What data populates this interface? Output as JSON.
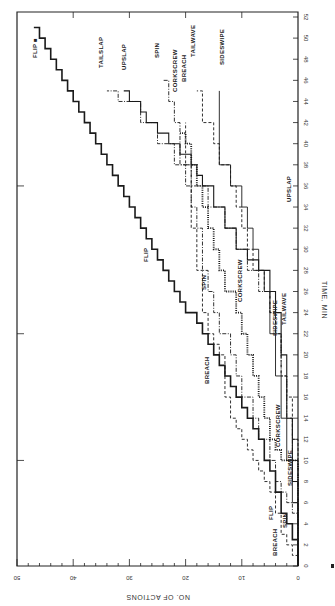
{
  "chart_data": {
    "type": "line",
    "subtype": "step",
    "orientation": "rotated-90",
    "title": "",
    "xlabel": "TIME, MIN",
    "ylabel": "NO. OF ACTIONS",
    "xlim": [
      0,
      52
    ],
    "ylim": [
      0,
      50
    ],
    "x_ticks": [
      0,
      2,
      4,
      6,
      8,
      10,
      12,
      14,
      16,
      18,
      20,
      22,
      24,
      26,
      28,
      30,
      32,
      34,
      36,
      38,
      40,
      42,
      44,
      46,
      48,
      50,
      52
    ],
    "y_ticks": [
      0,
      10,
      20,
      30,
      40,
      50
    ],
    "y_tick_labels": [
      "0",
      "10",
      "20",
      "30",
      "40",
      "50"
    ],
    "grid": false,
    "legend": "inline-labels",
    "series": [
      {
        "name": "FLIP",
        "style": "solid-bold",
        "label_end": "FLIP",
        "label_mid": "FLIP",
        "x": [
          0,
          2.5,
          4,
          5,
          7,
          9,
          10,
          12,
          13,
          14,
          15,
          16,
          17,
          18,
          19,
          20,
          21,
          22,
          23,
          24,
          25,
          26,
          27,
          28,
          29,
          30,
          31,
          32,
          33,
          34,
          35,
          36,
          37,
          38,
          39,
          40,
          41,
          42,
          43,
          44,
          45,
          46,
          47,
          48,
          49,
          50,
          51
        ],
        "y": [
          0,
          1,
          2,
          3,
          4,
          5,
          6,
          7,
          8,
          9,
          10,
          11,
          12,
          13,
          14,
          15,
          16,
          17,
          18,
          20,
          21,
          22,
          23,
          24,
          25,
          26,
          27,
          28,
          29,
          30,
          31,
          32,
          33,
          34,
          35,
          36,
          37,
          38,
          39,
          40,
          41,
          42,
          43,
          44,
          45,
          46,
          47
        ]
      },
      {
        "name": "BREACH",
        "style": "dashed",
        "x": [
          0,
          1,
          2,
          3,
          5,
          7,
          8,
          9,
          10,
          11,
          12,
          13,
          14,
          16,
          18,
          20,
          21,
          22,
          24,
          26,
          28,
          30,
          32,
          34,
          36,
          38,
          40,
          42
        ],
        "y": [
          0,
          1,
          2,
          3,
          4,
          5,
          6,
          7,
          8,
          9,
          10,
          11,
          12,
          13,
          13,
          14,
          15,
          16,
          17,
          17,
          18,
          18,
          19,
          19,
          19,
          20,
          20,
          20
        ]
      },
      {
        "name": "SPIN",
        "style": "dash-dot",
        "x": [
          0,
          5,
          6,
          7,
          8,
          10,
          12,
          14,
          16,
          18,
          20,
          22,
          24,
          26,
          28,
          30,
          32,
          34,
          36,
          38,
          40,
          42,
          44,
          46
        ],
        "y": [
          0,
          1,
          2,
          3,
          4,
          5,
          7,
          8,
          10,
          11,
          12,
          14,
          15,
          16,
          17,
          17,
          18,
          19,
          20,
          21,
          21,
          22,
          23,
          24
        ]
      },
      {
        "name": "CORKSCREW",
        "style": "dotted-bold",
        "x": [
          0,
          10,
          11,
          12,
          14,
          16,
          18,
          20,
          22,
          24,
          26,
          28,
          30,
          32,
          34,
          36,
          38,
          40,
          41
        ],
        "y": [
          0,
          3,
          4,
          5,
          6,
          7,
          8,
          9,
          10,
          11,
          13,
          14,
          15,
          16,
          17,
          18,
          19,
          20,
          21
        ]
      },
      {
        "name": "SIDESWIPE",
        "style": "solid-thin",
        "x": [
          0,
          6,
          10,
          14,
          18,
          22,
          26,
          28,
          30,
          32,
          34,
          36,
          38,
          45
        ],
        "y": [
          0,
          1,
          2,
          3,
          4,
          5,
          6,
          7,
          8,
          9,
          10,
          12,
          14,
          14
        ]
      },
      {
        "name": "TAILWAVE",
        "style": "dashed",
        "x": [
          0,
          12,
          16,
          18,
          20,
          22,
          24,
          26,
          28,
          30,
          32,
          34,
          36,
          38,
          40,
          42,
          45
        ],
        "y": [
          0,
          1,
          2,
          3,
          3,
          4,
          5,
          6,
          8,
          9,
          10,
          11,
          12,
          14,
          15,
          17,
          18
        ]
      },
      {
        "name": "UPSLAP",
        "style": "solid",
        "x": [
          0,
          8,
          14,
          20,
          24,
          26,
          28,
          29,
          30,
          32,
          34,
          36,
          37,
          38,
          39,
          40,
          41,
          42,
          43,
          44,
          45
        ],
        "y": [
          0,
          1,
          2,
          3,
          4,
          5,
          7,
          9,
          11,
          13,
          15,
          17,
          18,
          19,
          21,
          23,
          25,
          27,
          28,
          30,
          31
        ]
      },
      {
        "name": "TAILSLAP",
        "style": "dash-dot",
        "x": [
          0,
          10,
          14,
          18,
          22,
          24,
          26,
          28,
          30,
          32,
          34,
          36,
          38,
          40,
          42,
          44,
          45
        ],
        "y": [
          0,
          1,
          2,
          3,
          4,
          5,
          7,
          9,
          11,
          13,
          16,
          19,
          22,
          25,
          28,
          32,
          34
        ]
      }
    ],
    "annotations": [
      "BREACH",
      "FLIP",
      "SPIN",
      "CORKSCREW",
      "SIDESWIPE",
      "TAILWAVE",
      "UPSLAP",
      "BREACH",
      "SPIN",
      "CORKSCREW",
      "SIDESWIPE",
      "TAILWAVE",
      "UPSLAP",
      "TAILSLAP",
      "FLIP"
    ]
  },
  "labels": {
    "end": {
      "flip": "FLIP ■",
      "tailslap": "TAILSLAP",
      "upslap": "UPSLAP",
      "spin": "SPIN",
      "corkscrew": "CORKSCREW",
      "breach": "BREACH",
      "tailwave": "TAILWAVE",
      "sideswipe": "SIDESWIPE"
    },
    "mid": {
      "flip": "FLIP",
      "spin": "SPIN",
      "corkscrew": "CORKSCREW",
      "breach": "BREACH",
      "sideswipe": "SIDESWIPE",
      "tailwave": "TAILWAVE",
      "upslap": "UPSLAP"
    },
    "early": {
      "breach": "BREACH",
      "flip": "FLIP",
      "spin": "SPIN",
      "corkscrew": "CORKSCREW",
      "sideswipe": "SIDESWIPE"
    }
  }
}
